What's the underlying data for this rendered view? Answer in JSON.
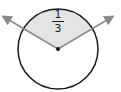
{
  "diagram": {
    "type": "circle-sector",
    "sector_fraction": {
      "numerator": "1",
      "denominator": "3"
    },
    "colors": {
      "sector_fill": "#e4e4e4",
      "outline": "#1a1a1a",
      "arrows": "#8a8a8a",
      "center_dot": "#111111"
    }
  }
}
